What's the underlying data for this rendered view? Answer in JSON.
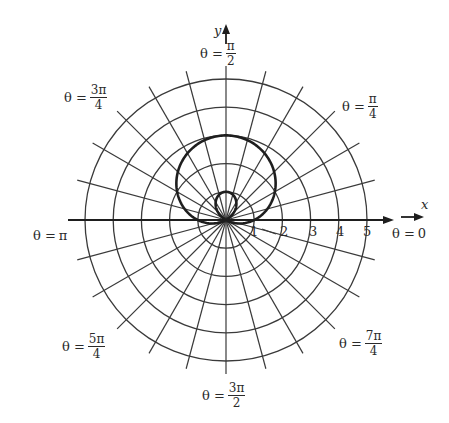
{
  "chart_data": {
    "type": "line",
    "subtype": "polar",
    "title": "",
    "equation": "r = 1 + 2 sin θ",
    "curve_name": "limaçon with inner loop",
    "xlabel": "x",
    "ylabel": "y",
    "r_ticks": [
      "1",
      "2",
      "3",
      "4",
      "5"
    ],
    "r_range": [
      0,
      5
    ],
    "grid": {
      "rings": [
        1,
        2,
        3,
        4,
        5
      ],
      "spoke_step": "π/12",
      "spoke_count": 24
    },
    "angle_labels": [
      {
        "text": "θ = 0",
        "lhs": "θ =",
        "num": "0",
        "den": ""
      },
      {
        "text": "θ = π/4",
        "lhs": "θ =",
        "num": "π",
        "den": "4"
      },
      {
        "text": "θ = π/2",
        "lhs": "θ =",
        "num": "π",
        "den": "2"
      },
      {
        "text": "θ = 3π/4",
        "lhs": "θ =",
        "num": "3π",
        "den": "4"
      },
      {
        "text": "θ = π",
        "lhs": "θ =",
        "num": "π",
        "den": ""
      },
      {
        "text": "θ = 5π/4",
        "lhs": "θ =",
        "num": "5π",
        "den": "4"
      },
      {
        "text": "θ = 3π/2",
        "lhs": "θ =",
        "num": "3π",
        "den": "2"
      },
      {
        "text": "θ = 7π/4",
        "lhs": "θ =",
        "num": "7π",
        "den": "4"
      }
    ],
    "curve_points_sample": [
      {
        "theta": "0",
        "r": 1
      },
      {
        "theta": "π/6",
        "r": 2
      },
      {
        "theta": "π/2",
        "r": 3
      },
      {
        "theta": "5π/6",
        "r": 2
      },
      {
        "theta": "π",
        "r": 1
      },
      {
        "theta": "7π/6",
        "r": 0
      },
      {
        "theta": "3π/2",
        "r": -1
      },
      {
        "theta": "11π/6",
        "r": 0
      },
      {
        "theta": "2π",
        "r": 1
      }
    ],
    "legend": null
  },
  "colors": {
    "grid": "#3a3a3a",
    "curve": "#1e1e1e",
    "axis": "#1e1e1e",
    "background": "#ffffff"
  },
  "labels": {
    "x_axis": "x",
    "y_axis": "y",
    "theta_0": {
      "lhs": "θ =",
      "val": "0"
    },
    "theta_pi": {
      "lhs": "θ =",
      "val": "π"
    },
    "theta_pi_2": {
      "lhs": "θ =",
      "num": "π",
      "den": "2"
    },
    "theta_pi_4": {
      "lhs": "θ =",
      "num": "π",
      "den": "4"
    },
    "theta_3pi_4": {
      "lhs": "θ =",
      "num": "3π",
      "den": "4"
    },
    "theta_5pi_4": {
      "lhs": "θ =",
      "num": "5π",
      "den": "4"
    },
    "theta_3pi_2": {
      "lhs": "θ =",
      "num": "3π",
      "den": "2"
    },
    "theta_7pi_4": {
      "lhs": "θ =",
      "num": "7π",
      "den": "4"
    },
    "ticks": [
      "1",
      "2",
      "3",
      "4",
      "5"
    ]
  }
}
